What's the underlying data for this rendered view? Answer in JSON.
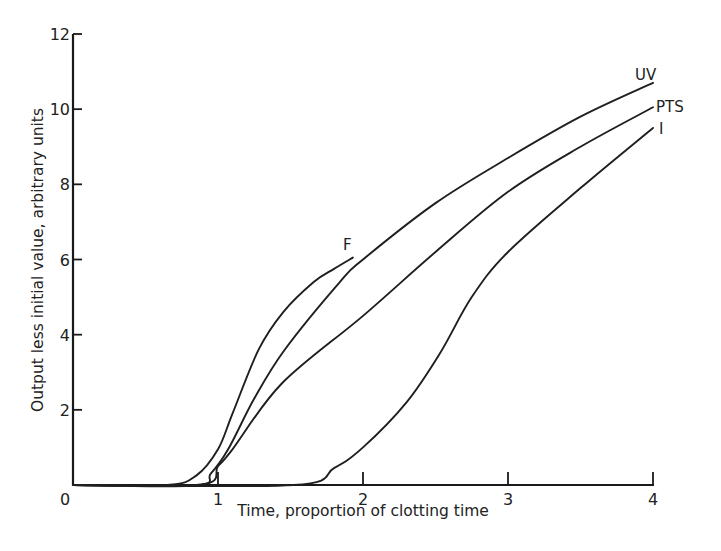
{
  "chart_data": {
    "type": "line",
    "title": "",
    "xlabel": "Time, proportion of clotting time",
    "ylabel": "Output less initial value, arbitrary units",
    "xlim": [
      0,
      4
    ],
    "ylim": [
      0,
      12
    ],
    "xticks": [
      0,
      1,
      2,
      3,
      4
    ],
    "yticks": [
      0,
      2,
      4,
      6,
      8,
      10,
      12
    ],
    "xtick_labels": [
      "0",
      "1",
      "2",
      "3",
      "4"
    ],
    "ytick_labels": [
      "0",
      "2",
      "4",
      "6",
      "8",
      "10",
      "12"
    ],
    "grid": false,
    "legend": "inline labels at curve ends",
    "series": [
      {
        "name": "F",
        "x": [
          0,
          0.65,
          0.85,
          1.0,
          1.1,
          1.28,
          1.45,
          1.66,
          1.8,
          1.93
        ],
        "y": [
          0,
          0,
          0.25,
          0.95,
          1.9,
          3.6,
          4.6,
          5.4,
          5.75,
          6.05
        ]
      },
      {
        "name": "UV",
        "x": [
          0,
          0.85,
          0.95,
          1.07,
          1.25,
          1.46,
          1.84,
          2.0,
          2.5,
          3.0,
          3.5,
          4.0
        ],
        "y": [
          0,
          0,
          0.3,
          0.95,
          2.3,
          3.6,
          5.4,
          6.0,
          7.5,
          8.7,
          9.8,
          10.7
        ],
        "label": "UV"
      },
      {
        "name": "PTS",
        "x": [
          0,
          0.88,
          1.0,
          1.1,
          1.44,
          2.0,
          2.5,
          3.0,
          3.5,
          4.0
        ],
        "y": [
          0,
          0,
          0.5,
          0.95,
          2.7,
          4.5,
          6.2,
          7.8,
          9.0,
          10.05
        ],
        "label": "PTS"
      },
      {
        "name": "I",
        "x": [
          0,
          1.52,
          1.8,
          2.0,
          2.3,
          2.53,
          2.75,
          3.0,
          3.5,
          4.0
        ],
        "y": [
          0,
          0,
          0.45,
          1.0,
          2.2,
          3.5,
          5.0,
          6.2,
          7.9,
          9.5
        ],
        "label": "I"
      }
    ]
  },
  "labels": {
    "F": "F",
    "UV": "UV",
    "PTS": "PTS",
    "I": "I"
  }
}
